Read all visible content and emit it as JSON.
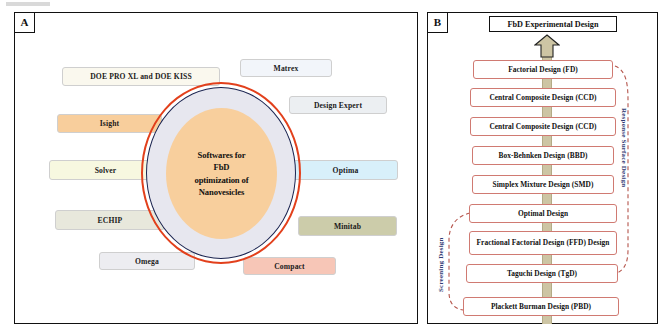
{
  "figure": {
    "panel_a": {
      "tag": "A",
      "center_label_lines": [
        "Softwares for",
        "FbD",
        "optimization of",
        "Nanovesicles"
      ],
      "software_labels": [
        {
          "name": "DOE PRO XL and DOE KISS",
          "color": "#faf8ee"
        },
        {
          "name": "Matrex",
          "color": "#f2f5fa"
        },
        {
          "name": "Design Expert",
          "color": "#eceff2"
        },
        {
          "name": "Isight",
          "color": "#f8ce9c"
        },
        {
          "name": "Solver",
          "color": "#f7f8e0"
        },
        {
          "name": "Optima",
          "color": "#d8f0fa"
        },
        {
          "name": "ECHIP",
          "color": "#e8e8dc"
        },
        {
          "name": "Minitab",
          "color": "#ccccaa"
        },
        {
          "name": "Omega",
          "color": "#ededf1"
        },
        {
          "name": "Compact",
          "color": "#f7c6b7"
        }
      ],
      "ring_colors": {
        "outer_ring": "#e2401c",
        "inner_ring": "#1b2450",
        "ring_fill": "#e7e7ef",
        "core_fill": "#f8cf9d"
      }
    },
    "panel_b": {
      "tag": "B",
      "title": "FbD Experimental Design",
      "design_boxes": [
        "Factorial Design (FD)",
        "Central Composite Design (CCD)",
        "Central Composite Design (CCD)",
        "Box-Behnken Design (BBD)",
        "Simplex Mixture Design (SMD)",
        "Optimal Design",
        "Fractional Factorial Design (FFD) Design",
        "Taguchi Design (TgD)",
        "Plackett Burman Design (PBD)"
      ],
      "side_captions": {
        "right": "Response Surface Design",
        "left": "Screening Design"
      },
      "colors": {
        "box_border": "#d07a72",
        "spine": "#cdc5a4",
        "dashed_bracket": "#b5554c",
        "caption_text": "#2f3a72",
        "arrow_fill": "#cdc5a4"
      }
    }
  }
}
